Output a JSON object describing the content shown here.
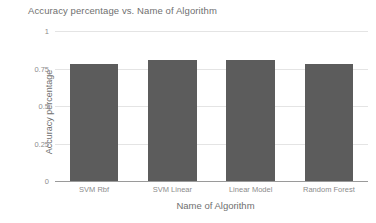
{
  "chart_data": {
    "type": "bar",
    "title": "Accuracy percentage vs. Name of Algorithm",
    "xlabel": "Name of Algorithm",
    "ylabel": "Accuracy percentage",
    "categories": [
      "SVM Rbf",
      "SVM Linear",
      "Linear Model",
      "Random Forest"
    ],
    "values": [
      0.78,
      0.81,
      0.81,
      0.78
    ],
    "ylim": [
      0,
      1
    ],
    "yticks": [
      0,
      0.25,
      0.5,
      0.75,
      1
    ],
    "ytick_labels": [
      "0",
      "0.25",
      "0.5",
      "0.75",
      "1"
    ],
    "grid": true,
    "legend": false,
    "series": [
      {
        "name": "Accuracy percentage",
        "color": "#5c5c5c",
        "values": [
          0.78,
          0.81,
          0.81,
          0.78
        ]
      }
    ]
  },
  "colors": {
    "bar": "#5c5c5c",
    "gridline": "#e4e4e4",
    "axis": "#9a9a9a",
    "title_text": "#6f6f6f",
    "tick_text": "#8c8c8c",
    "background": "#ffffff"
  }
}
